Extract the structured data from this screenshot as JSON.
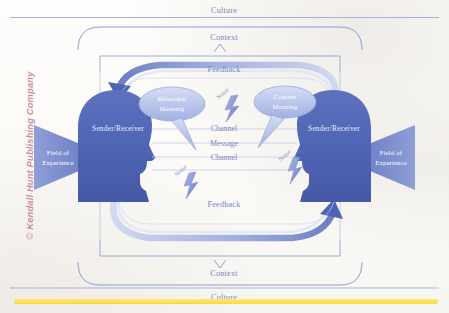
{
  "figure": {
    "credit": "Kendall Hunt Publishing Company",
    "credit_mark": "©",
    "accent_blue": "#4f63b5",
    "light_blue": "#b9c4e8",
    "label_blue": "#7b87c4",
    "yellow_bar": "#fde04a",
    "pink": "#c98fa8"
  },
  "outer": {
    "culture_top": "Culture",
    "culture_bottom": "Culture",
    "context_top": "Context",
    "context_bottom": "Context"
  },
  "loop": {
    "feedback_top": "Feedback",
    "feedback_bottom": "Feedback"
  },
  "participants": {
    "left": {
      "role": "Sender/Receiver",
      "field": [
        "Field of",
        "Experience"
      ]
    },
    "right": {
      "role": "Sender/Receiver",
      "field": [
        "Field of",
        "Experience"
      ]
    }
  },
  "bubbles": {
    "left": [
      "Relational",
      "Meaning"
    ],
    "right": [
      "Content",
      "Meaning"
    ]
  },
  "center_stack": {
    "line1": "Channel",
    "line2": "Message",
    "line3": "Channel"
  },
  "noise": {
    "items": [
      {
        "label": "Noise",
        "position": "top-center"
      },
      {
        "label": "Noise",
        "position": "mid-right"
      },
      {
        "label": "Noise",
        "position": "bottom-left"
      }
    ]
  }
}
